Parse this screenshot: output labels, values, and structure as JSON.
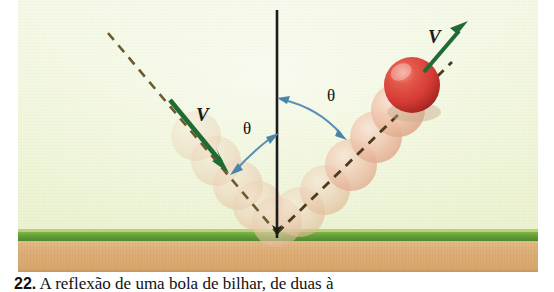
{
  "figure": {
    "kind": "physics-illustration",
    "panel": {
      "background_top": "#f4f8e4",
      "background_bottom": "#eaf2cf",
      "grass_color": "#5d9a33",
      "soil_color": "#dfb078"
    },
    "normal_line": {
      "name": "normal-line",
      "color": "#1b1b1b",
      "x": 277,
      "y_top": 10,
      "y_bottom": 238
    },
    "incoming": {
      "velocity_label": "V",
      "arrow_color": "#1f6b34",
      "dashed_color": "#6b5a2e",
      "angle_label": "θ"
    },
    "outgoing": {
      "velocity_label": "V",
      "arrow_color": "#1f6b34",
      "dashed_color": "#4a3b1c",
      "angle_label": "θ"
    },
    "ball": {
      "name": "billiard-ball",
      "color": "#d8413a",
      "highlight": "#ef8f7f",
      "cx": 412,
      "cy": 85,
      "r": 28
    },
    "ghost_trail": {
      "color": "#e6c3a4",
      "count_incoming": 5,
      "count_outgoing": 5
    },
    "arc_color": "#5b90b5"
  },
  "labels": {
    "v_incoming": "V",
    "v_outgoing": "V",
    "theta_left": "θ",
    "theta_right": "θ"
  },
  "caption": {
    "number": "22.",
    "text": "A reflexão de uma bola de bilhar, de duas à"
  }
}
